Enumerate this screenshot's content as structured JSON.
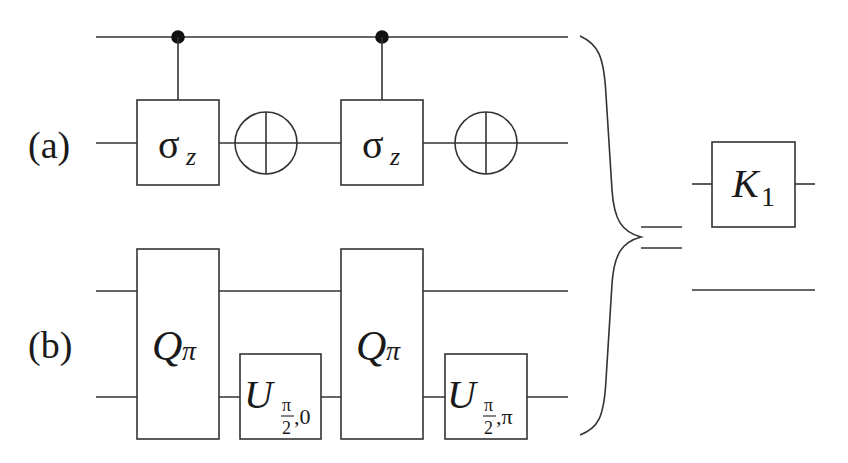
{
  "diagram": {
    "type": "quantum-circuit-equivalence",
    "labels": {
      "a": "(a)",
      "b": "(b)"
    },
    "circuit_a": {
      "gates": [
        {
          "kind": "controlled",
          "symbol": "σ",
          "subscript": "z"
        },
        {
          "kind": "target",
          "symbol": "⊕"
        },
        {
          "kind": "controlled",
          "symbol": "σ",
          "subscript": "z"
        },
        {
          "kind": "target",
          "symbol": "⊕"
        }
      ]
    },
    "circuit_b": {
      "gates": [
        {
          "kind": "two-qubit",
          "symbol": "Q",
          "subscript": "π"
        },
        {
          "kind": "single",
          "symbol": "U",
          "sub_frac_num": "π",
          "sub_frac_den": "2",
          "sub_rest": ",0"
        },
        {
          "kind": "two-qubit",
          "symbol": "Q",
          "subscript": "π"
        },
        {
          "kind": "single",
          "symbol": "U",
          "sub_frac_num": "π",
          "sub_frac_den": "2",
          "sub_rest": ",π"
        }
      ]
    },
    "relation": "=",
    "result": {
      "gate": {
        "symbol": "K",
        "subscript": "1"
      }
    }
  }
}
